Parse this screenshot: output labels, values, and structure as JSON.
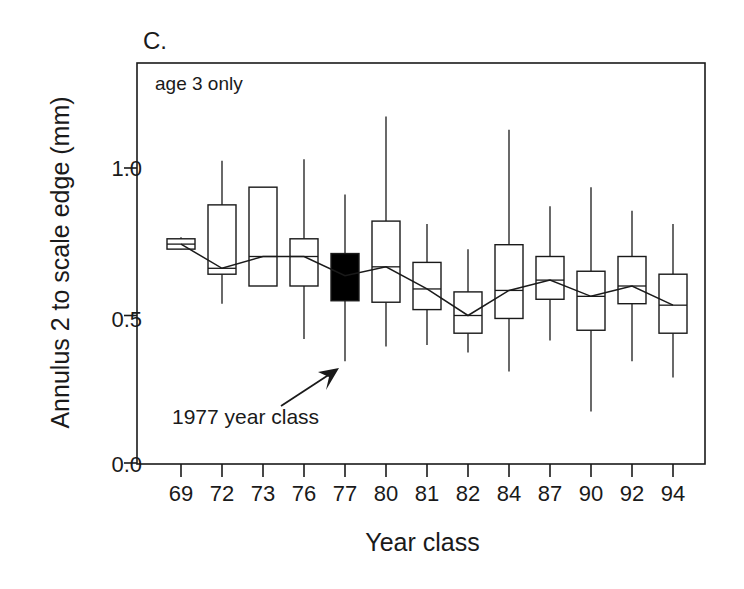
{
  "panel": {
    "label": "C.",
    "inner_note": "age 3 only"
  },
  "annotation": {
    "text": "1977 year class",
    "points_to": "77"
  },
  "axes": {
    "ylabel": "Annulus 2 to scale edge (mm)",
    "xlabel": "Year class",
    "yticks": [
      "0.0",
      "0.5",
      "1.0"
    ]
  },
  "colors": {
    "line": "#1a1a1a",
    "box_fill": "#ffffff",
    "highlight_fill": "#000000",
    "axis": "#1a1a1a"
  },
  "chart_data": {
    "type": "boxplot",
    "title": "C.",
    "subtitle": "age 3 only",
    "xlabel": "Year class",
    "ylabel": "Annulus 2 to scale edge (mm)",
    "ylim": [
      0.0,
      1.28
    ],
    "ytick_values": [
      0.0,
      0.5,
      1.0
    ],
    "grid": false,
    "legend": "none",
    "categories": [
      "69",
      "72",
      "73",
      "76",
      "77",
      "80",
      "81",
      "82",
      "84",
      "87",
      "90",
      "92",
      "94"
    ],
    "boxes": [
      {
        "category": "69",
        "whisker_low": 0.735,
        "q1": 0.725,
        "median": 0.742,
        "q3": 0.76,
        "whisker_high": 0.765,
        "highlighted": false
      },
      {
        "category": "72",
        "whisker_low": 0.54,
        "q1": 0.64,
        "median": 0.66,
        "q3": 0.875,
        "whisker_high": 1.025,
        "highlighted": false
      },
      {
        "category": "73",
        "whisker_low": 0.6,
        "q1": 0.6,
        "median": 0.7,
        "q3": 0.935,
        "whisker_high": 0.935,
        "highlighted": false
      },
      {
        "category": "76",
        "whisker_low": 0.42,
        "q1": 0.6,
        "median": 0.7,
        "q3": 0.76,
        "whisker_high": 1.03,
        "highlighted": false
      },
      {
        "category": "77",
        "whisker_low": 0.345,
        "q1": 0.55,
        "median": 0.635,
        "q3": 0.71,
        "whisker_high": 0.91,
        "highlighted": true
      },
      {
        "category": "80",
        "whisker_low": 0.395,
        "q1": 0.545,
        "median": 0.665,
        "q3": 0.82,
        "whisker_high": 1.175,
        "highlighted": false
      },
      {
        "category": "81",
        "whisker_low": 0.4,
        "q1": 0.52,
        "median": 0.59,
        "q3": 0.68,
        "whisker_high": 0.81,
        "highlighted": false
      },
      {
        "category": "82",
        "whisker_low": 0.375,
        "q1": 0.44,
        "median": 0.5,
        "q3": 0.58,
        "whisker_high": 0.725,
        "highlighted": false
      },
      {
        "category": "84",
        "whisker_low": 0.31,
        "q1": 0.49,
        "median": 0.585,
        "q3": 0.74,
        "whisker_high": 1.13,
        "highlighted": false
      },
      {
        "category": "87",
        "whisker_low": 0.415,
        "q1": 0.555,
        "median": 0.62,
        "q3": 0.7,
        "whisker_high": 0.87,
        "highlighted": false
      },
      {
        "category": "90",
        "whisker_low": 0.175,
        "q1": 0.45,
        "median": 0.565,
        "q3": 0.65,
        "whisker_high": 0.935,
        "highlighted": false
      },
      {
        "category": "92",
        "whisker_low": 0.345,
        "q1": 0.54,
        "median": 0.6,
        "q3": 0.7,
        "whisker_high": 0.855,
        "highlighted": false
      },
      {
        "category": "94",
        "whisker_low": 0.29,
        "q1": 0.44,
        "median": 0.535,
        "q3": 0.64,
        "whisker_high": 0.81,
        "highlighted": false
      }
    ],
    "median_line": {
      "name": "median trend",
      "x": [
        "69",
        "72",
        "73",
        "76",
        "77",
        "80",
        "81",
        "82",
        "84",
        "87",
        "90",
        "92",
        "94"
      ],
      "values": [
        0.742,
        0.66,
        0.7,
        0.7,
        0.635,
        0.665,
        0.59,
        0.5,
        0.585,
        0.62,
        0.565,
        0.6,
        0.535
      ]
    }
  }
}
